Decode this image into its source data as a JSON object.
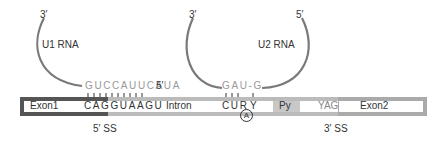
{
  "u1": {
    "end3": "3′",
    "label": "U1 RNA",
    "sequence": "GUCCAUUCAUA",
    "end5": "5′"
  },
  "u2": {
    "end3": "3′",
    "end5": "5′",
    "label": "U2 RNA",
    "sequence": "GAU-G"
  },
  "pre_mrna": {
    "exon1": "Exon1",
    "five_prime_seq": "CAGGUAAGU",
    "intron": "Intron",
    "branch_seq": "CUR",
    "branch_y": "Y",
    "branch_a": "A",
    "py": "Py",
    "yag": "YAG",
    "exon2": "Exon2"
  },
  "sites": {
    "five_ss": "5′ SS",
    "three_ss": "3′ SS"
  },
  "colors": {
    "exon1_border": "#555555",
    "intron_border": "#bbbbbb",
    "exon2_border": "#aaaaaa",
    "py_fill": "#c8c8c8",
    "rna_strand": "#777777",
    "rna_text": "#999999"
  }
}
